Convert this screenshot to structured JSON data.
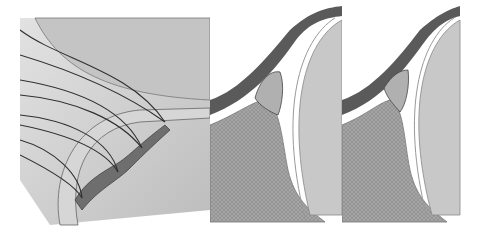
{
  "figure": {
    "panels": [
      {
        "id": "panel-1",
        "description": "Arthroscopic view of labral tear with sutures passed through the labrum"
      },
      {
        "id": "panel-2",
        "description": "Cross-section showing detached labrum with suture at glenoid rim"
      },
      {
        "id": "panel-3",
        "description": "Cross-section showing repaired labrum reattached to glenoid rim"
      }
    ],
    "colors": {
      "background": "#ffffff",
      "panel_bg": "#cfcfcf",
      "bone": "#9a9a9a",
      "cartilage": "#c8c8c8",
      "capsule_dark": "#5a5a5a",
      "suture": "#2f2f2f",
      "tear": "#6e6e6e"
    }
  }
}
